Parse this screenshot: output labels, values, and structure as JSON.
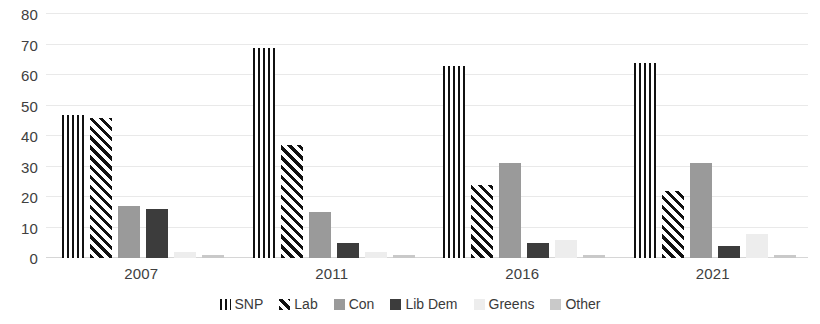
{
  "chart_data": {
    "type": "bar",
    "title": "",
    "subtitle": "",
    "xlabel": "",
    "ylabel": "",
    "categories": [
      "2007",
      "2011",
      "2016",
      "2021"
    ],
    "ylim": [
      0,
      80
    ],
    "yticks": [
      0,
      10,
      20,
      30,
      40,
      50,
      60,
      70,
      80
    ],
    "grid": true,
    "legend_position": "bottom",
    "series": [
      {
        "name": "SNP",
        "pattern": "vertical-stripes",
        "color": "#111111",
        "values": [
          47,
          69,
          63,
          64
        ]
      },
      {
        "name": "Lab",
        "pattern": "diagonal-stripes",
        "color": "#111111",
        "values": [
          46,
          37,
          24,
          22
        ]
      },
      {
        "name": "Con",
        "pattern": "solid",
        "color": "#9a9a9a",
        "values": [
          17,
          15,
          31,
          31
        ]
      },
      {
        "name": "Lib Dem",
        "pattern": "solid",
        "color": "#3c3c3c",
        "values": [
          16,
          5,
          5,
          4
        ]
      },
      {
        "name": "Greens",
        "pattern": "solid",
        "color": "#ededed",
        "values": [
          2,
          2,
          6,
          8
        ]
      },
      {
        "name": "Other",
        "pattern": "solid",
        "color": "#c9c9c9",
        "values": [
          1,
          1,
          1,
          1
        ]
      }
    ]
  }
}
